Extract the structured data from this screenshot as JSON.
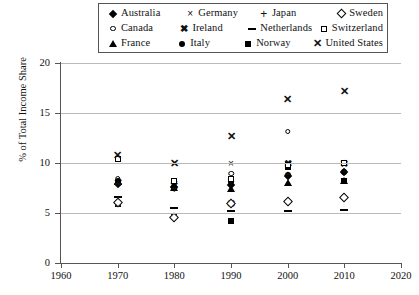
{
  "legend": {
    "rows": [
      [
        {
          "label": "Australia",
          "marker": "diamond-filled"
        },
        {
          "label": "Germany",
          "marker": "times-thin"
        },
        {
          "label": "Japan",
          "marker": "plus"
        },
        {
          "label": "Sweden",
          "marker": "diamond-open"
        }
      ],
      [
        {
          "label": "Canada",
          "marker": "circle-open"
        },
        {
          "label": "Ireland",
          "marker": "star-bold"
        },
        {
          "label": "Netherlands",
          "marker": "dash"
        },
        {
          "label": "Switzerland",
          "marker": "square-open"
        }
      ],
      [
        {
          "label": "France",
          "marker": "triangle-filled"
        },
        {
          "label": "Italy",
          "marker": "circle-filled"
        },
        {
          "label": "Norway",
          "marker": "square-filled"
        },
        {
          "label": "United States",
          "marker": "times-bold"
        }
      ]
    ]
  },
  "chart_data": {
    "type": "scatter",
    "title": "",
    "xlabel": "",
    "ylabel": "% of Total Income Share",
    "xlim": [
      1960,
      2020
    ],
    "ylim": [
      0,
      20
    ],
    "xticks": [
      1960,
      1970,
      1980,
      1990,
      2000,
      2010,
      2020
    ],
    "yticks": [
      0,
      5,
      10,
      15,
      20
    ],
    "grid": "horizontal",
    "legend_position": "top",
    "x": [
      1970,
      1980,
      1990,
      2000,
      2010
    ],
    "series": [
      {
        "name": "Australia",
        "marker": "diamond-filled",
        "values": [
          8.1,
          7.8,
          8.0,
          8.9,
          9.3
        ]
      },
      {
        "name": "Canada",
        "marker": "circle-open",
        "values": [
          8.7,
          8.4,
          9.2,
          13.4,
          10.3
        ]
      },
      {
        "name": "France",
        "marker": "triangle-filled",
        "values": [
          8.3,
          7.7,
          7.6,
          8.2,
          8.4
        ]
      },
      {
        "name": "Germany",
        "marker": "times-thin",
        "values": [
          10.5,
          10.1,
          10.1,
          10.0,
          10.1
        ]
      },
      {
        "name": "Ireland",
        "marker": "star-bold",
        "values": [
          8.2,
          7.9,
          6.1,
          10.1,
          10.1
        ]
      },
      {
        "name": "Italy",
        "marker": "circle-filled",
        "values": [
          8.4,
          7.8,
          8.3,
          9.0,
          9.3
        ]
      },
      {
        "name": "Japan",
        "marker": "plus",
        "values": [
          8.0,
          7.5,
          8.2,
          8.9,
          9.2
        ]
      },
      {
        "name": "Netherlands",
        "marker": "dash",
        "values": [
          7.0,
          5.9,
          5.6,
          5.6,
          5.7
        ]
      },
      {
        "name": "Norway",
        "marker": "square-filled",
        "values": [
          6.1,
          4.9,
          4.4,
          9.8,
          8.4
        ]
      },
      {
        "name": "Sweden",
        "marker": "diamond-open",
        "values": [
          6.2,
          4.7,
          6.1,
          6.3,
          6.7
        ]
      },
      {
        "name": "Switzerland",
        "marker": "square-open",
        "values": [
          10.6,
          8.4,
          8.6,
          10.0,
          10.2
        ]
      },
      {
        "name": "United States",
        "marker": "times-bold",
        "values": [
          10.9,
          10.1,
          12.8,
          16.5,
          17.3
        ]
      }
    ]
  }
}
